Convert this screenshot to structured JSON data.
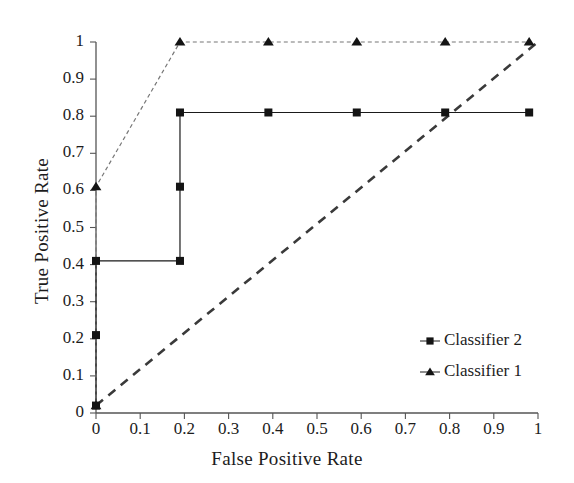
{
  "chart_data": {
    "type": "line",
    "title": "",
    "xlabel": "False Positive Rate",
    "ylabel": "True Positive Rate",
    "xlim": [
      0,
      1
    ],
    "ylim": [
      0,
      1
    ],
    "xticks": [
      "0",
      "0.1",
      "0.2",
      "0.3",
      "0.4",
      "0.5",
      "0.6",
      "0.7",
      "0.8",
      "0.9",
      "1"
    ],
    "yticks": [
      "0",
      "0.1",
      "0.2",
      "0.3",
      "0.4",
      "0.5",
      "0.6",
      "0.7",
      "0.8",
      "0.9",
      "1"
    ],
    "xtick_values": [
      0,
      0.1,
      0.2,
      0.3,
      0.4,
      0.5,
      0.6,
      0.7,
      0.8,
      0.9,
      1
    ],
    "ytick_values": [
      0,
      0.1,
      0.2,
      0.3,
      0.4,
      0.5,
      0.6,
      0.7,
      0.8,
      0.9,
      1
    ],
    "grid": false,
    "legend_position": "lower-right",
    "series": [
      {
        "name": "Classifier 2",
        "marker": "square",
        "linestyle": "solid",
        "color": "#1a1a1a",
        "x": [
          0,
          0,
          0,
          0.19,
          0.19,
          0.19,
          0.39,
          0.59,
          0.79,
          0.98
        ],
        "y": [
          0.02,
          0.21,
          0.41,
          0.41,
          0.61,
          0.81,
          0.81,
          0.81,
          0.81,
          0.81
        ]
      },
      {
        "name": "Classifier 1",
        "marker": "triangle",
        "linestyle": "dashed",
        "color": "#1a1a1a",
        "x": [
          0,
          0,
          0.19,
          0.39,
          0.59,
          0.79,
          0.98
        ],
        "y": [
          0.02,
          0.61,
          1,
          1,
          1,
          1,
          1
        ]
      },
      {
        "name": "chance-diagonal",
        "marker": "none",
        "linestyle": "dashed",
        "color": "#3a3a3a",
        "x": [
          0,
          1
        ],
        "y": [
          0.02,
          1
        ]
      }
    ],
    "reference_line": {
      "name": "chance-diagonal",
      "from": [
        0,
        0.02
      ],
      "to": [
        1,
        1
      ],
      "style": "dashed"
    }
  },
  "legend": {
    "entries": [
      {
        "label": "Classifier 2",
        "marker": "square"
      },
      {
        "label": "Classifier 1",
        "marker": "triangle"
      }
    ]
  },
  "axes": {
    "x_title": "False Positive Rate",
    "y_title": "True Positive Rate"
  }
}
